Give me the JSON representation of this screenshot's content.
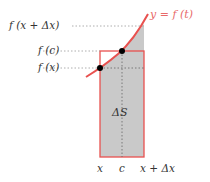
{
  "diagram": {
    "curve_label": "y = f (t)",
    "y_labels": {
      "f_x_plus_dx": "f (x + Δx)",
      "f_c": "f (c)",
      "f_x": "f (x)"
    },
    "x_labels": {
      "x": "x",
      "c": "c",
      "x_plus_dx": "x + Δx"
    },
    "area_label": "ΔS",
    "colors": {
      "curve": "#e8514f",
      "rectangle": "#e8514f",
      "area_fill": "#c8c8c8",
      "point": "#000000",
      "guide": "#999999"
    }
  }
}
